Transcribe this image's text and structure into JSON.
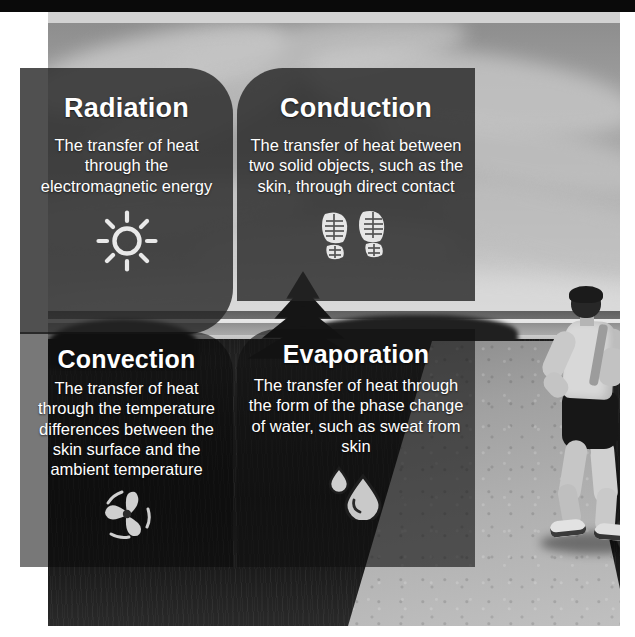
{
  "poster": {
    "title": "Four mechanisms of heat transfer",
    "top_bar_color": "#0a0a0a",
    "band_color": "#d2d2d2",
    "card_text_color": "#ffffff"
  },
  "background": {
    "scene": "grayscale photo of a runner on a gravel path with cloudy sky and dark grass field",
    "subject": "runner"
  },
  "cards": [
    {
      "id": "radiation",
      "title": "Radiation",
      "description": "The transfer of heat through the electromagnetic energy",
      "icon": "sun-icon"
    },
    {
      "id": "conduction",
      "title": "Conduction",
      "description": "The transfer of heat between two solid objects, such as the skin, through direct contact",
      "icon": "footprints-icon"
    },
    {
      "id": "convection",
      "title": "Convection",
      "description": "The transfer of heat through the temperature differences between the skin surface and the ambient temperature",
      "icon": "fan-icon"
    },
    {
      "id": "evaporation",
      "title": "Evaporation",
      "description": "The transfer of heat through the form of the phase change of water, such as sweat from skin",
      "icon": "water-droplets-icon"
    }
  ]
}
